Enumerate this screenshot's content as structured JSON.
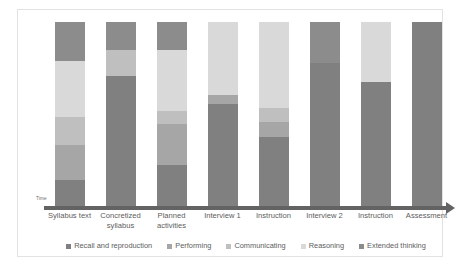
{
  "chart_data": {
    "type": "bar",
    "stacked": true,
    "orientation": "vertical",
    "title": "",
    "xlabel": "Time",
    "ylabel": "",
    "grid": false,
    "legend_position": "bottom",
    "ylim": [
      0,
      100
    ],
    "axis_arrow": true,
    "categories": [
      "Syllabus text",
      "Concretized syllabus",
      "Planned activities",
      "Interview 1",
      "Instruction",
      "Interview 2",
      "Instruction",
      "Assessment"
    ],
    "category_lines": [
      [
        "Syllabus text"
      ],
      [
        "Concretized",
        "syllabus"
      ],
      [
        "Planned",
        "activities"
      ],
      [
        "Interview 1"
      ],
      [
        "Instruction"
      ],
      [
        "Interview 2"
      ],
      [
        "Instruction"
      ],
      [
        "Assessment"
      ]
    ],
    "series": [
      {
        "name": "Recall and reproduction",
        "color": "#808080",
        "values": [
          15,
          71,
          23,
          56,
          38,
          78,
          68,
          100
        ]
      },
      {
        "name": "Performing",
        "color": "#a6a6a6",
        "values": [
          19,
          0,
          22,
          5,
          8,
          0,
          0,
          0
        ]
      },
      {
        "name": "Communicating",
        "color": "#bfbfbf",
        "values": [
          15,
          14,
          7,
          0,
          8,
          0,
          0,
          0
        ]
      },
      {
        "name": "Reasoning",
        "color": "#d9d9d9",
        "values": [
          30,
          0,
          33,
          39,
          46,
          0,
          32,
          0
        ]
      },
      {
        "name": "Extended thinking",
        "color": "#8c8c8c",
        "values": [
          21,
          15,
          15,
          0,
          0,
          22,
          0,
          0
        ]
      }
    ],
    "bar_totals": [
      100,
      100,
      100,
      100,
      100,
      100,
      100,
      100
    ]
  },
  "legend": {
    "items": [
      {
        "label": "Recall and reproduction",
        "color": "#808080"
      },
      {
        "label": "Performing",
        "color": "#a6a6a6"
      },
      {
        "label": "Communicating",
        "color": "#bfbfbf"
      },
      {
        "label": "Reasoning",
        "color": "#d9d9d9"
      },
      {
        "label": "Extended thinking",
        "color": "#8c8c8c"
      }
    ]
  },
  "axis": {
    "time_label": "Time"
  }
}
